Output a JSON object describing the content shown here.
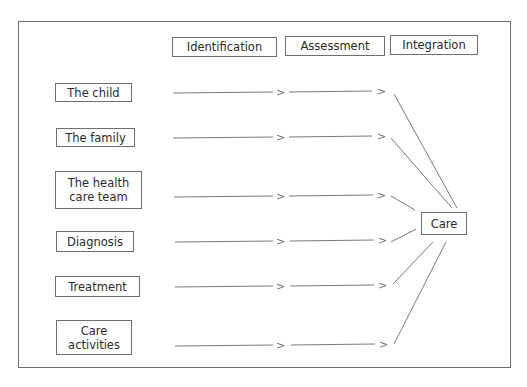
{
  "diagram": {
    "stages": [
      {
        "label": "Identification"
      },
      {
        "label": "Assessment"
      },
      {
        "label": "Integration"
      }
    ],
    "inputs": [
      {
        "label": "The child"
      },
      {
        "label": "The family"
      },
      {
        "label": "The health care team"
      },
      {
        "label": "Diagnosis"
      },
      {
        "label": "Treatment"
      },
      {
        "label": "Care activities"
      }
    ],
    "output": {
      "label": "Care"
    },
    "arrow_glyph": ">",
    "colors": {
      "line": "#7a7a7a",
      "border": "#6e6e6e",
      "text": "#2a2a2a"
    }
  }
}
